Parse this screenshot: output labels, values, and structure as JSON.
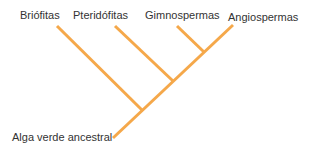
{
  "diagram": {
    "type": "cladogram",
    "line_color": "#F5A84A",
    "taxa": [
      {
        "label": "Briófitas"
      },
      {
        "label": "Pteridófitas"
      },
      {
        "label": "Gimnospermas"
      },
      {
        "label": "Angiospermas"
      }
    ],
    "root_label": "Alga verde ancestral"
  }
}
